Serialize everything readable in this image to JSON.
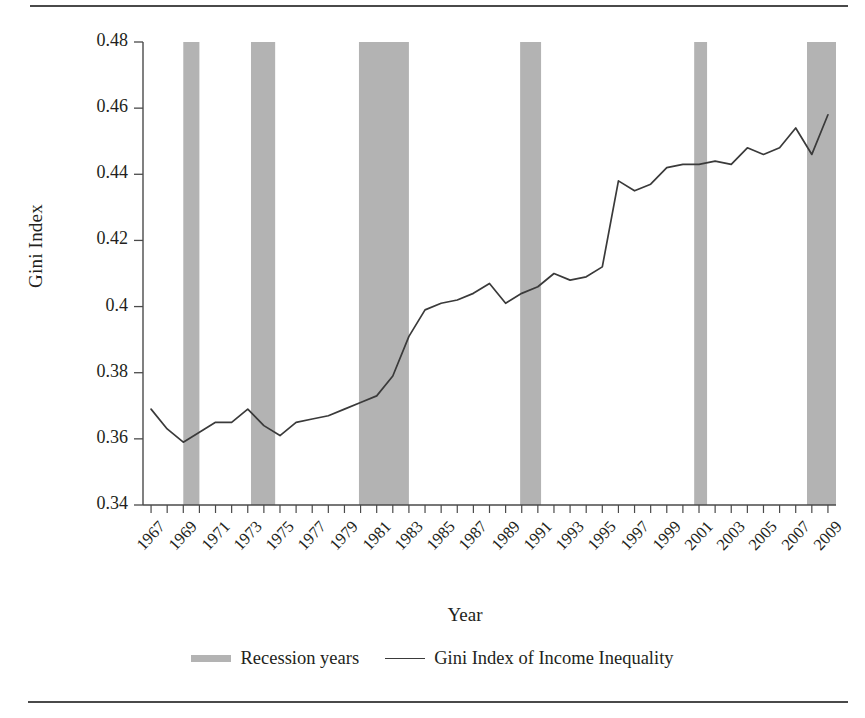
{
  "figure": {
    "y_axis_title": "Gini Index",
    "x_axis_title": "Year"
  },
  "legend": {
    "items": [
      {
        "label": "Recession years",
        "marker": "gray-band-swatch",
        "color": "#b3b3b3"
      },
      {
        "label": "Gini Index of Income Inequality",
        "marker": "line-swatch",
        "color": "#3a3a3a"
      }
    ]
  },
  "colors": {
    "recession_band": "#b3b3b3",
    "line": "#3a3a3a",
    "axis": "#4a4a4a",
    "text": "#231f20",
    "background": "#ffffff"
  },
  "chart_data": {
    "type": "line",
    "title": "",
    "xlabel": "Year",
    "ylabel": "Gini Index",
    "xlim": [
      1966.5,
      2009.5
    ],
    "ylim": [
      0.34,
      0.48
    ],
    "yticks": [
      0.34,
      0.36,
      0.38,
      0.4,
      0.42,
      0.44,
      0.46,
      0.48
    ],
    "ytick_labels": [
      "0.34",
      "0.36",
      "0.38",
      "0.4",
      "0.42",
      "0.44",
      "0.46",
      "0.48"
    ],
    "xtick_labels": [
      "1967",
      "1969",
      "1971",
      "1973",
      "1975",
      "1977",
      "1979",
      "1981",
      "1983",
      "1985",
      "1987",
      "1989",
      "1991",
      "1993",
      "1995",
      "1997",
      "1999",
      "2001",
      "2003",
      "2005",
      "2007",
      "2009"
    ],
    "xtick_step": 2,
    "grid": false,
    "legend_position": "bottom",
    "x": [
      1967,
      1968,
      1969,
      1970,
      1971,
      1972,
      1973,
      1974,
      1975,
      1976,
      1977,
      1978,
      1979,
      1980,
      1981,
      1982,
      1983,
      1984,
      1985,
      1986,
      1987,
      1988,
      1989,
      1990,
      1991,
      1992,
      1993,
      1994,
      1995,
      1996,
      1997,
      1998,
      1999,
      2000,
      2001,
      2002,
      2003,
      2004,
      2005,
      2006,
      2007,
      2008,
      2009
    ],
    "series": [
      {
        "name": "Gini Index of Income Inequality",
        "values": [
          0.369,
          0.363,
          0.359,
          0.362,
          0.365,
          0.365,
          0.369,
          0.364,
          0.361,
          0.365,
          0.366,
          0.367,
          0.369,
          0.371,
          0.373,
          0.379,
          0.391,
          0.399,
          0.401,
          0.402,
          0.404,
          0.407,
          0.401,
          0.404,
          0.406,
          0.41,
          0.408,
          0.409,
          0.412,
          0.438,
          0.435,
          0.437,
          0.442,
          0.443,
          0.443,
          0.444,
          0.443,
          0.448,
          0.446,
          0.448,
          0.454,
          0.446,
          0.458
        ]
      }
    ],
    "recession_bands": [
      {
        "label": "1969-1970 recession",
        "start": 1969.0,
        "end": 1970.0
      },
      {
        "label": "1973-1975 recession",
        "start": 1973.2,
        "end": 1974.7
      },
      {
        "label": "1980-1982 recession",
        "start": 1979.9,
        "end": 1983.0
      },
      {
        "label": "1990-1991 recession",
        "start": 1989.9,
        "end": 1991.2
      },
      {
        "label": "2001 recession",
        "start": 2000.7,
        "end": 2001.5
      },
      {
        "label": "2008-2009 recession",
        "start": 2007.7,
        "end": 2009.5
      }
    ]
  }
}
